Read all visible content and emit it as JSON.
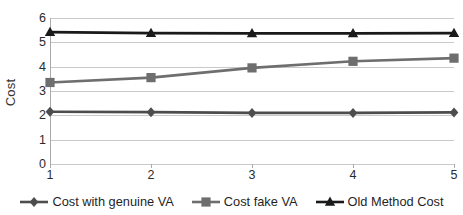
{
  "chart_data": {
    "type": "line",
    "title": "",
    "xlabel": "",
    "ylabel": "Cost",
    "x": [
      1,
      2,
      3,
      4,
      5
    ],
    "categories": [
      "1",
      "2",
      "3",
      "4",
      "5"
    ],
    "xlim": [
      1,
      5
    ],
    "ylim": [
      0,
      6
    ],
    "yticks": [
      "6",
      "5",
      "4",
      "3",
      "2",
      "1",
      "0"
    ],
    "ytick_values": [
      6,
      5,
      4,
      3,
      2,
      1,
      0
    ],
    "grid": true,
    "legend_position": "bottom",
    "series": [
      {
        "name": "Cost with genuine VA",
        "marker": "diamond",
        "color": "#4d4d4d",
        "values": [
          2.15,
          2.13,
          2.1,
          2.1,
          2.12
        ]
      },
      {
        "name": "Cost fake VA",
        "marker": "square",
        "color": "#6e6e6e",
        "values": [
          3.35,
          3.55,
          3.95,
          4.22,
          4.35
        ]
      },
      {
        "name": "Old Method Cost",
        "marker": "triangle",
        "color": "#1a1a1a",
        "values": [
          5.42,
          5.38,
          5.37,
          5.37,
          5.38
        ]
      }
    ]
  },
  "axes": {
    "y_title": "Cost",
    "y_tick_labels": [
      "6",
      "5",
      "4",
      "3",
      "2",
      "1",
      "0"
    ],
    "x_tick_labels": [
      "1",
      "2",
      "3",
      "4",
      "5"
    ]
  },
  "legend": {
    "items": [
      {
        "label": "Cost with genuine VA",
        "marker": "diamond-marker",
        "color": "#4d4d4d"
      },
      {
        "label": "Cost fake VA",
        "marker": "square-marker",
        "color": "#6e6e6e"
      },
      {
        "label": "Old Method Cost",
        "marker": "triangle-marker",
        "color": "#1a1a1a"
      }
    ]
  },
  "colors": {
    "gridline": "#c9c9c9",
    "axis": "#aaaaaa",
    "background": "#ffffff",
    "text": "#2b2b2b"
  }
}
